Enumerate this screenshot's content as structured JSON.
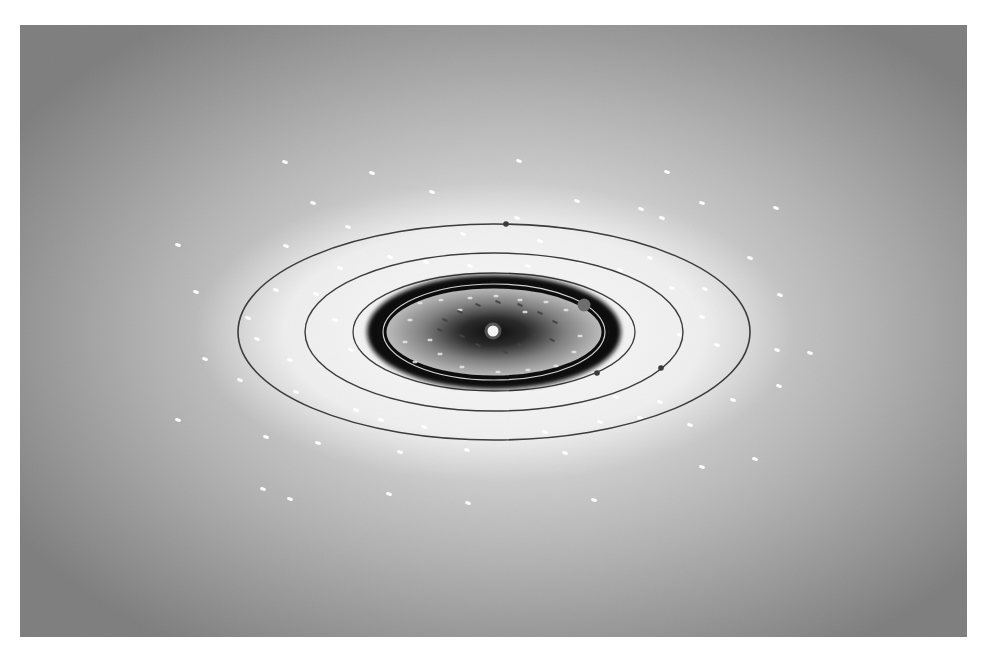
{
  "canvas": {
    "width": 986,
    "height": 654,
    "background": "#ffffff"
  },
  "frame": {
    "x": 20,
    "y": 25,
    "width": 947,
    "height": 612
  },
  "colors": {
    "bg_edge": "#3a3a3a",
    "bg_mid": "#8a8a8a",
    "bg_glow": "#e6e6e6",
    "glow_inner": "#f2f2f2",
    "orbit_line": "#3c3c3c",
    "ring_dark": "#111111",
    "disk_mid": "#9a9a9a",
    "disk_core": "#141414",
    "sun": "#f4f4f4",
    "planet": "#6e6e6e",
    "planet_small": "#3a3a3a",
    "star": "#ffffff",
    "inner_dash": "#444444"
  },
  "sun": {
    "cx": 493,
    "cy": 331,
    "r": 5.5
  },
  "orbits": [
    {
      "name": "outer-orbit",
      "cx": 494,
      "cy": 332,
      "rx": 256,
      "ry": 108,
      "stroke": 1.6
    },
    {
      "name": "second-orbit",
      "cx": 494,
      "cy": 332,
      "rx": 189,
      "ry": 79,
      "stroke": 1.4
    },
    {
      "name": "third-orbit",
      "cx": 494,
      "cy": 332,
      "rx": 141,
      "ry": 59,
      "stroke": 1.3
    },
    {
      "name": "inner-light-orbit",
      "cx": 494,
      "cy": 332,
      "rx": 106,
      "ry": 42,
      "stroke": 1.2
    }
  ],
  "dark_ring": {
    "cx": 494,
    "cy": 332,
    "rx": 119,
    "ry": 49,
    "width": 16
  },
  "disk": {
    "cx": 494,
    "cy": 332,
    "rx": 103,
    "ry": 40
  },
  "planets": [
    {
      "name": "planet-outer-top",
      "cx": 506,
      "cy": 224,
      "r": 2.8,
      "tone": "small"
    },
    {
      "name": "planet-inner-ring",
      "cx": 584,
      "cy": 305,
      "r": 6.5,
      "tone": "large"
    },
    {
      "name": "planet-third-orbit",
      "cx": 597,
      "cy": 373,
      "r": 2.8,
      "tone": "small"
    },
    {
      "name": "planet-second-orbit",
      "cx": 661,
      "cy": 368,
      "r": 2.8,
      "tone": "small"
    }
  ],
  "stars": [
    [
      285,
      162
    ],
    [
      372,
      173
    ],
    [
      519,
      161
    ],
    [
      667,
      172
    ],
    [
      432,
      192
    ],
    [
      313,
      203
    ],
    [
      577,
      201
    ],
    [
      641,
      209
    ],
    [
      702,
      203
    ],
    [
      776,
      208
    ],
    [
      178,
      245
    ],
    [
      286,
      246
    ],
    [
      348,
      227
    ],
    [
      463,
      234
    ],
    [
      517,
      218
    ],
    [
      560,
      228
    ],
    [
      662,
      218
    ],
    [
      750,
      258
    ],
    [
      780,
      295
    ],
    [
      196,
      292
    ],
    [
      248,
      318
    ],
    [
      257,
      339
    ],
    [
      205,
      359
    ],
    [
      240,
      380
    ],
    [
      178,
      420
    ],
    [
      266,
      437
    ],
    [
      318,
      443
    ],
    [
      400,
      452
    ],
    [
      467,
      450
    ],
    [
      565,
      453
    ],
    [
      690,
      425
    ],
    [
      640,
      418
    ],
    [
      733,
      400
    ],
    [
      755,
      459
    ],
    [
      263,
      489
    ],
    [
      290,
      499
    ],
    [
      389,
      494
    ],
    [
      468,
      503
    ],
    [
      594,
      500
    ],
    [
      702,
      467
    ],
    [
      810,
      353
    ],
    [
      777,
      350
    ],
    [
      779,
      386
    ],
    [
      702,
      317
    ],
    [
      705,
      289
    ],
    [
      717,
      345
    ],
    [
      276,
      290
    ],
    [
      316,
      294
    ],
    [
      335,
      320
    ],
    [
      290,
      360
    ],
    [
      351,
      350
    ],
    [
      296,
      392
    ],
    [
      356,
      410
    ],
    [
      381,
      420
    ],
    [
      424,
      427
    ],
    [
      545,
      432
    ],
    [
      600,
      422
    ],
    [
      616,
      397
    ],
    [
      660,
      402
    ],
    [
      680,
      335
    ],
    [
      672,
      288
    ],
    [
      426,
      262
    ],
    [
      470,
      266
    ],
    [
      528,
      266
    ],
    [
      580,
      262
    ],
    [
      620,
      270
    ],
    [
      650,
      258
    ],
    [
      340,
      268
    ],
    [
      390,
      257
    ],
    [
      540,
      241
    ]
  ],
  "inner_stars": [
    [
      420,
      303
    ],
    [
      441,
      300
    ],
    [
      470,
      298
    ],
    [
      496,
      296
    ],
    [
      520,
      300
    ],
    [
      546,
      302
    ],
    [
      566,
      310
    ],
    [
      430,
      340
    ],
    [
      440,
      354
    ],
    [
      462,
      367
    ],
    [
      498,
      372
    ],
    [
      528,
      370
    ],
    [
      556,
      366
    ],
    [
      574,
      352
    ],
    [
      580,
      336
    ],
    [
      410,
      320
    ],
    [
      405,
      342
    ],
    [
      415,
      362
    ],
    [
      460,
      310
    ],
    [
      525,
      312
    ]
  ],
  "inner_dashes": [
    [
      445,
      320
    ],
    [
      460,
      312
    ],
    [
      478,
      305
    ],
    [
      498,
      302
    ],
    [
      520,
      305
    ],
    [
      540,
      313
    ],
    [
      555,
      322
    ],
    [
      462,
      336
    ],
    [
      478,
      345
    ],
    [
      520,
      345
    ],
    [
      536,
      336
    ],
    [
      505,
      352
    ],
    [
      440,
      330
    ],
    [
      552,
      340
    ]
  ]
}
